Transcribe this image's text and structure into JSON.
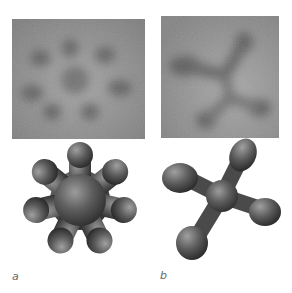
{
  "figure": {
    "panels": [
      {
        "id": "a",
        "label": "a",
        "micrograph": {
          "description": "blurry grayscale image with seven dark lobes radiating from center",
          "lobes": 7
        },
        "model": {
          "description": "3D rendered seven-lobed star shape",
          "lobes": 7
        }
      },
      {
        "id": "b",
        "label": "b",
        "micrograph": {
          "description": "blurry grayscale image with four dark lobes in an X-like arrangement",
          "lobes": 4
        },
        "model": {
          "description": "3D rendered four-lobed shape",
          "lobes": 4
        }
      }
    ],
    "colors": {
      "background": "#ffffff",
      "micrograph_bg": "#8c8c8c",
      "micrograph_lobe": "#555555",
      "model_dark": "#2a2a2a",
      "model_light": "#9a9a9a",
      "label": "#666666"
    }
  }
}
